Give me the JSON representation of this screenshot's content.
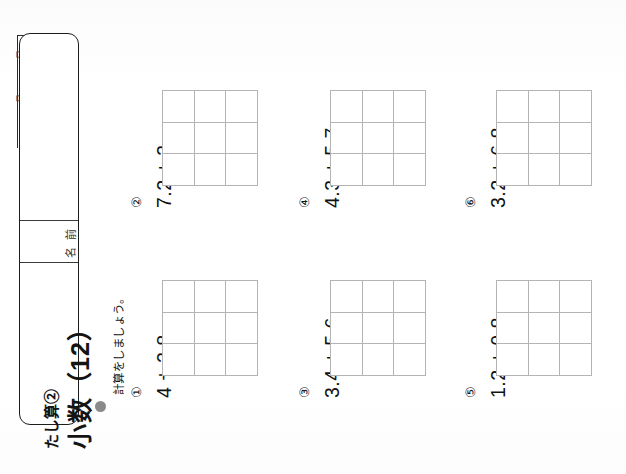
{
  "worksheet": {
    "title_main": "小数（12）",
    "title_sub": "たし算②",
    "name_label": "名前",
    "date_month": "月",
    "date_day": "日",
    "instruction": "計算をしましょう。"
  },
  "problems": [
    {
      "index": "②",
      "expression": "7.2 + 3",
      "column": 0,
      "row": 0
    },
    {
      "index": "①",
      "expression": "4 + 2.8",
      "column": 0,
      "row": 1
    },
    {
      "index": "④",
      "expression": "4.3 + 5.7",
      "column": 1,
      "row": 0
    },
    {
      "index": "③",
      "expression": "3.4 + 5.6",
      "column": 1,
      "row": 1
    },
    {
      "index": "⑥",
      "expression": "3.2 + 6.8",
      "column": 2,
      "row": 0
    },
    {
      "index": "⑤",
      "expression": "1.2 + 0.8",
      "column": 2,
      "row": 1
    }
  ],
  "grid": {
    "columns": 3,
    "rows": 3,
    "line_color": "#b4b4b4"
  },
  "colors": {
    "ink": "#141414",
    "grid_line": "#b4b4b4",
    "bullet": "#8a8a8a",
    "paper": "#ffffff"
  }
}
